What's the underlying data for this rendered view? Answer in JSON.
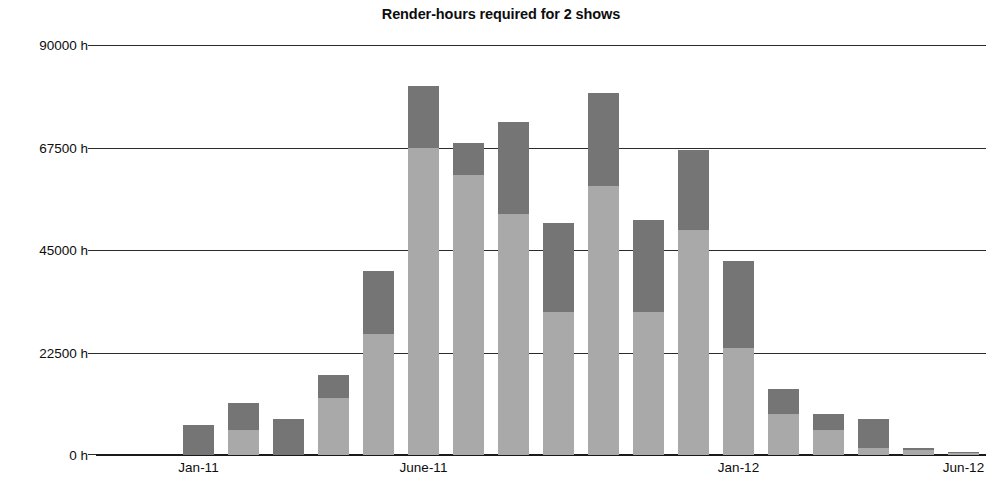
{
  "chart_data": {
    "type": "bar",
    "subtype": "stacked-vertical-bar",
    "title": "Render-hours required for 2 shows",
    "xlabel": "",
    "ylabel": "",
    "ylim": [
      0,
      90000
    ],
    "y_unit": "h",
    "grid": true,
    "grid_axis": "y",
    "legend": "none",
    "y_ticks": [
      0,
      22500,
      45000,
      67500,
      90000
    ],
    "y_tick_labels": [
      "0 h",
      "22500 h",
      "45000 h",
      "67500 h",
      "90000 h"
    ],
    "x_tick_labels": [
      "Jan-11",
      "June-11",
      "Jan-12",
      "Jun-12"
    ],
    "x_tick_indices": [
      2,
      7,
      14,
      19
    ],
    "categories": [
      "Nov-10",
      "Dec-10",
      "Jan-11",
      "Feb-11",
      "Mar-11",
      "Apr-11",
      "May-11",
      "June-11",
      "July-11",
      "Aug-11",
      "Sep-11",
      "Oct-11",
      "Nov-11",
      "Dec-11",
      "Jan-12",
      "Feb-12",
      "Mar-12",
      "Apr-12",
      "May-12",
      "Jun-12"
    ],
    "series": [
      {
        "name": "Show 1",
        "color": "#a9a9a9",
        "stack_position": "lower",
        "values": [
          0,
          0,
          0,
          5500,
          0,
          12500,
          26500,
          67500,
          61500,
          53000,
          31500,
          59000,
          31500,
          49500,
          23500,
          9000,
          5500,
          1500,
          1200,
          500
        ]
      },
      {
        "name": "Show 2",
        "color": "#757575",
        "stack_position": "upper",
        "values": [
          0,
          0,
          6500,
          6000,
          8000,
          5000,
          14000,
          13500,
          7000,
          20000,
          19500,
          20500,
          20000,
          17500,
          19000,
          5500,
          3500,
          6500,
          400,
          200
        ]
      }
    ],
    "totals": [
      0,
      0,
      6500,
      11500,
      8000,
      17500,
      40500,
      81000,
      68500,
      73000,
      51000,
      79500,
      51500,
      67000,
      42500,
      14500,
      9000,
      8000,
      1600,
      700
    ],
    "bar_layout": {
      "first_bar_center_index": 2,
      "bar_width_px": 31,
      "bar_pitch_px": 45
    }
  },
  "colors": {
    "lower_segment": "#a9a9a9",
    "upper_segment": "#757575",
    "axis": "#1a1a1a",
    "gridline": "#2b2b2b",
    "text": "#0d0d0d",
    "background": "#ffffff"
  }
}
